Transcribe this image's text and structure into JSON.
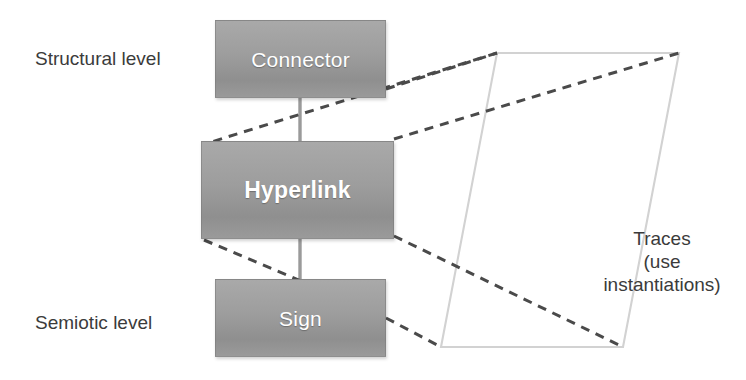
{
  "diagram": {
    "background_color": "#ffffff",
    "nodes": [
      {
        "id": "connector",
        "label": "Connector",
        "fill_color": "#9a9a9a",
        "text_color": "#ffffff",
        "x": 215,
        "y": 20,
        "width": 171,
        "height": 78
      },
      {
        "id": "hyperlink",
        "label": "Hyperlink",
        "fill_color": "#9a9a9a",
        "text_color": "#ffffff",
        "x": 201,
        "y": 141,
        "width": 193,
        "height": 98
      },
      {
        "id": "sign",
        "label": "Sign",
        "fill_color": "#9a9a9a",
        "text_color": "#ffffff",
        "x": 215,
        "y": 279,
        "width": 171,
        "height": 78
      }
    ],
    "level_labels": [
      {
        "id": "structural",
        "text": "Structural level",
        "x": 35,
        "y": 49
      },
      {
        "id": "semiotic",
        "text": "Semiotic level",
        "x": 35,
        "y": 313
      }
    ],
    "traces_caption": {
      "lines": [
        "Traces",
        "(use",
        "instantiations)"
      ],
      "text_color": "#3b3b3b"
    },
    "parallelogram": {
      "id": "traces-region",
      "stroke_color": "#d2d2d2",
      "fill": "none",
      "points": [
        [
          497,
          53
        ],
        [
          679,
          53
        ],
        [
          623,
          347
        ],
        [
          441,
          347
        ]
      ]
    },
    "solid_connectors": [
      {
        "id": "connector-to-hyperlink",
        "from": "connector",
        "to": "hyperlink",
        "x1": 300,
        "y1": 98,
        "x2": 300,
        "y2": 141,
        "color": "#9a9a9a"
      },
      {
        "id": "hyperlink-to-sign",
        "from": "hyperlink",
        "to": "sign",
        "x1": 300,
        "y1": 239,
        "x2": 300,
        "y2": 279,
        "color": "#9a9a9a"
      }
    ],
    "dashed_links": [
      {
        "id": "connector-to-region-top-left",
        "from": "connector",
        "to": "traces-region",
        "x1": 386,
        "y1": 89,
        "x2": 497,
        "y2": 53,
        "color": "#4a4a4a"
      },
      {
        "id": "region-top-left-to-hyperlink",
        "from": "traces-region",
        "to": "hyperlink",
        "x1": 497,
        "y1": 53,
        "x2": 210,
        "y2": 143,
        "color": "#4a4a4a"
      },
      {
        "id": "hyperlink-to-region-top-right",
        "from": "hyperlink",
        "to": "traces-region",
        "x1": 394,
        "y1": 139,
        "x2": 679,
        "y2": 53,
        "color": "#4a4a4a"
      },
      {
        "id": "hyperlink-to-region-bottom-right",
        "from": "hyperlink",
        "to": "traces-region",
        "x1": 394,
        "y1": 236,
        "x2": 623,
        "y2": 347,
        "color": "#4a4a4a"
      },
      {
        "id": "hyperlink-to-sign-dashed",
        "from": "hyperlink",
        "to": "sign",
        "x1": 205,
        "y1": 240,
        "x2": 300,
        "y2": 281,
        "color": "#4a4a4a"
      },
      {
        "id": "sign-to-region-bottom-left",
        "from": "sign",
        "to": "traces-region",
        "x1": 386,
        "y1": 318,
        "x2": 441,
        "y2": 347,
        "color": "#4a4a4a"
      }
    ]
  }
}
